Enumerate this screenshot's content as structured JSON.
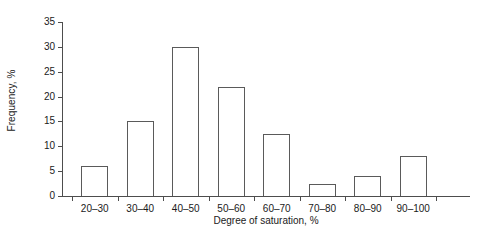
{
  "chart_data": {
    "type": "bar",
    "title": "",
    "subtitle": "",
    "xlabel": "Degree of saturation, %",
    "ylabel": "Frequency, %",
    "categories": [
      "20–30",
      "30–40",
      "40–50",
      "50–60",
      "60–70",
      "70–80",
      "80–90",
      "90–100"
    ],
    "values": [
      6,
      15,
      30,
      22,
      12.5,
      2.5,
      4,
      8
    ],
    "ylim": [
      0,
      35
    ],
    "ytick_values": [
      0,
      5,
      10,
      15,
      20,
      25,
      30,
      35
    ],
    "ytick_labels": [
      "0",
      "5",
      "10",
      "15",
      "20",
      "25",
      "30",
      "35"
    ],
    "grid": false,
    "legend": null,
    "legend_position": "none",
    "bar_style": {
      "fill": "#ffffff",
      "edge": "#5a5a5a"
    },
    "axis_color": "#4d4d4d",
    "background": "#ffffff"
  }
}
